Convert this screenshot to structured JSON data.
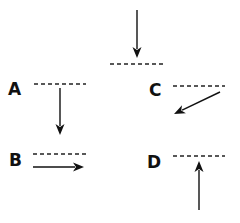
{
  "diagram": {
    "title": "",
    "colors": {
      "ink": "#111111",
      "background": "#ffffff"
    },
    "incident": {
      "description": "reference arrow pointing down onto a dashed surface",
      "arrow": {
        "x1": 137,
        "y1": 10,
        "x2": 137,
        "y2": 58
      },
      "surface": {
        "x1": 110,
        "y1": 64,
        "x2": 163,
        "y2": 64
      }
    },
    "options": [
      {
        "label": "A",
        "label_pos": {
          "x": 8,
          "y": 95
        },
        "surface": {
          "x1": 34,
          "y1": 84,
          "x2": 86,
          "y2": 84
        },
        "arrow": {
          "x1": 60,
          "y1": 88,
          "x2": 60,
          "y2": 135
        },
        "direction": "down"
      },
      {
        "label": "B",
        "label_pos": {
          "x": 9,
          "y": 166
        },
        "surface": {
          "x1": 33,
          "y1": 154,
          "x2": 86,
          "y2": 154
        },
        "arrow": {
          "x1": 33,
          "y1": 167,
          "x2": 84,
          "y2": 167
        },
        "direction": "right"
      },
      {
        "label": "C",
        "label_pos": {
          "x": 149,
          "y": 96
        },
        "surface": {
          "x1": 173,
          "y1": 86,
          "x2": 225,
          "y2": 86
        },
        "arrow": {
          "x1": 220,
          "y1": 92,
          "x2": 174,
          "y2": 114
        },
        "direction": "down-left"
      },
      {
        "label": "D",
        "label_pos": {
          "x": 147,
          "y": 168
        },
        "surface": {
          "x1": 173,
          "y1": 156,
          "x2": 225,
          "y2": 156
        },
        "arrow": {
          "x1": 199,
          "y1": 210,
          "x2": 199,
          "y2": 161
        },
        "direction": "up"
      }
    ]
  }
}
